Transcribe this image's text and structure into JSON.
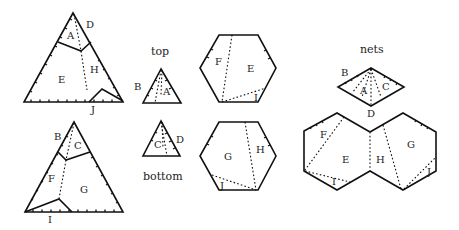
{
  "captions": {
    "top": "top",
    "bottom": "bottom",
    "nets": "nets"
  },
  "labels": {
    "A": "A",
    "B": "B",
    "C": "C",
    "D": "D",
    "E": "E",
    "F": "F",
    "G": "G",
    "H": "H",
    "I": "I",
    "J": "J"
  },
  "colors": {
    "line": "#111111",
    "text": "#222222",
    "background": "#ffffff"
  }
}
